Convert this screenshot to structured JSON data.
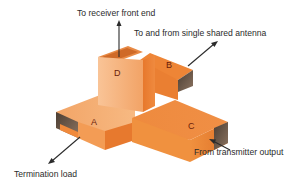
{
  "diagram": {
    "ports": {
      "A": "A",
      "B": "B",
      "C": "C",
      "D": "D"
    },
    "labels": {
      "receiver": "To receiver front end",
      "antenna": "To and from single shared antenna",
      "termination": "Termination load",
      "transmitter": "From transmitter output"
    },
    "colors": {
      "orange_light": "#f7b27a",
      "orange_mid": "#f08a3c",
      "orange_dark": "#d9641e",
      "interior_shadow": "#5a4a3a",
      "arrow": "#2b2b2b",
      "text": "#2b2b2b",
      "port_label": "#6b1d0a"
    }
  }
}
